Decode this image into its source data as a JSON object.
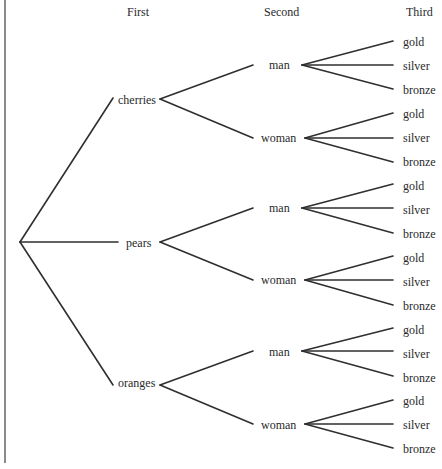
{
  "headers": {
    "first": "First",
    "second": "Second",
    "third": "Third"
  },
  "tree": {
    "first": [
      "cherries",
      "pears",
      "oranges"
    ],
    "second": [
      "man",
      "woman"
    ],
    "third": [
      "gold",
      "silver",
      "bronze"
    ]
  },
  "labels": {
    "first": [
      {
        "text": "cherries",
        "x": 118,
        "y": 93
      },
      {
        "text": "pears",
        "x": 126,
        "y": 236
      },
      {
        "text": "oranges",
        "x": 118,
        "y": 376
      }
    ],
    "second": [
      {
        "text": "man",
        "x": 269,
        "y": 58
      },
      {
        "text": "woman",
        "x": 261,
        "y": 131
      },
      {
        "text": "man",
        "x": 269,
        "y": 201
      },
      {
        "text": "woman",
        "x": 261,
        "y": 273
      },
      {
        "text": "man",
        "x": 269,
        "y": 345
      },
      {
        "text": "woman",
        "x": 261,
        "y": 418
      }
    ],
    "third": [
      {
        "text": "gold",
        "x": 403,
        "y": 35
      },
      {
        "text": "silver",
        "x": 403,
        "y": 59
      },
      {
        "text": "bronze",
        "x": 403,
        "y": 83
      },
      {
        "text": "gold",
        "x": 403,
        "y": 107
      },
      {
        "text": "silver",
        "x": 403,
        "y": 131
      },
      {
        "text": "bronze",
        "x": 403,
        "y": 155
      },
      {
        "text": "gold",
        "x": 403,
        "y": 179
      },
      {
        "text": "silver",
        "x": 403,
        "y": 203
      },
      {
        "text": "bronze",
        "x": 403,
        "y": 227
      },
      {
        "text": "gold",
        "x": 403,
        "y": 251
      },
      {
        "text": "silver",
        "x": 403,
        "y": 275
      },
      {
        "text": "bronze",
        "x": 403,
        "y": 299
      },
      {
        "text": "gold",
        "x": 403,
        "y": 323
      },
      {
        "text": "silver",
        "x": 403,
        "y": 347
      },
      {
        "text": "bronze",
        "x": 403,
        "y": 371
      },
      {
        "text": "gold",
        "x": 403,
        "y": 394
      },
      {
        "text": "silver",
        "x": 403,
        "y": 418
      },
      {
        "text": "bronze",
        "x": 403,
        "y": 442
      }
    ]
  },
  "colors": {
    "line": "#2f2f2f",
    "text": "#2a2a2a",
    "border": "#8a8a8a"
  }
}
